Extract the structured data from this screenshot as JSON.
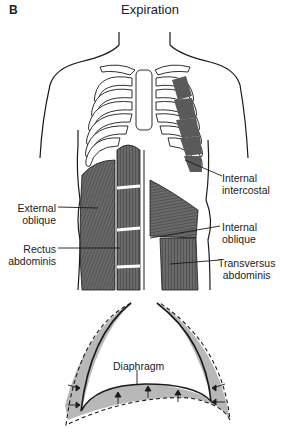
{
  "figure": {
    "panel_letter": "B",
    "title": "Expiration"
  },
  "labels": {
    "internal_intercostal": [
      "Internal",
      "intercostal"
    ],
    "external_oblique": [
      "External",
      "oblique"
    ],
    "rectus_abdominis": [
      "Rectus",
      "abdominis"
    ],
    "internal_oblique": [
      "Internal",
      "oblique"
    ],
    "transversus_abdominis": [
      "Transversus",
      "abdominis"
    ],
    "diaphragm": "Diaphragm"
  },
  "colors": {
    "line": "#1a1a1a",
    "muscle": "#5a5a5a",
    "shade": "#b8b8b8",
    "background": "#ffffff"
  }
}
